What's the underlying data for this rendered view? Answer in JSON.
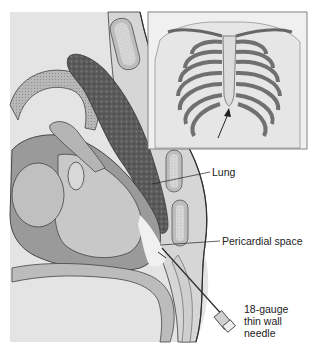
{
  "figure": {
    "colors": {
      "background": "#ffffff",
      "tissue_light": "#e2e2e2",
      "tissue_mid": "#c4c4c4",
      "tissue_dark": "#8e8e8e",
      "lung": "#5e5e5e",
      "outline": "#3a3a3a"
    }
  },
  "labels": {
    "lung": "Lung",
    "pericardial_space": "Pericardial space",
    "needle_line1": "18-gauge",
    "needle_line2": "thin wall",
    "needle_line3": "needle"
  },
  "inset": {
    "subject": "anterior rib cage",
    "arrow_target": "xiphoid process"
  }
}
